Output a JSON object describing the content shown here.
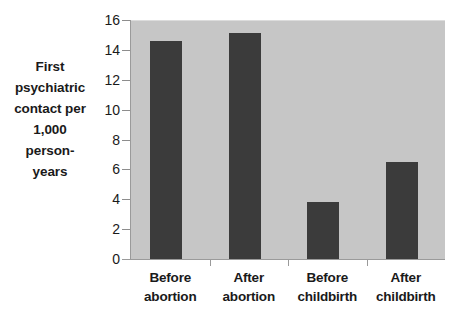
{
  "chart_data": {
    "type": "bar",
    "title": "",
    "subtitle": "",
    "xlabel": "",
    "ylabel": "First psychiatric contact per 1,000 person-years",
    "ylabel_lines": [
      "First",
      "psychiatric",
      "contact per",
      "1,000",
      "person-",
      "years"
    ],
    "categories": [
      "Before abortion",
      "After abortion",
      "Before childbirth",
      "After childbirth"
    ],
    "category_lines": [
      [
        "Before",
        "abortion"
      ],
      [
        "After",
        "abortion"
      ],
      [
        "Before",
        "childbirth"
      ],
      [
        "After",
        "childbirth"
      ]
    ],
    "values": [
      14.6,
      15.1,
      3.8,
      6.5
    ],
    "ylim": [
      0,
      16
    ],
    "yticks": [
      16,
      14,
      12,
      10,
      8,
      6,
      4,
      2,
      0
    ],
    "ytick_labels": [
      "16",
      "14",
      "12",
      "10",
      "8",
      "6",
      "4",
      "2",
      "0"
    ],
    "grid": false,
    "legend": "none",
    "colors": {
      "bar": "#3b3b3b",
      "plot_background": "#c6c6c6",
      "figure_background": "#ffffff",
      "axis_line": "#9a9a9a",
      "text": "#1a1a1a"
    }
  }
}
